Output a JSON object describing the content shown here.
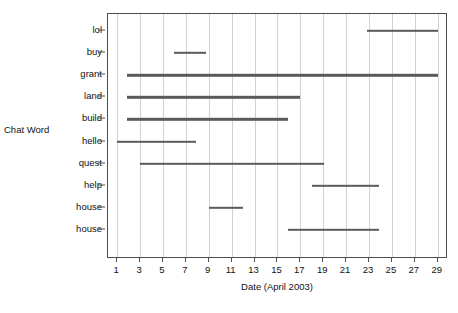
{
  "chart_data": {
    "type": "bar",
    "orientation": "horizontal",
    "title": "",
    "subtitle": "",
    "xlabel": "Date (April 2003)",
    "ylabel": "Chat Word",
    "xlim": [
      0.2,
      29.9
    ],
    "ylim": [
      0,
      11
    ],
    "grid": "vertical-only",
    "legend": "none",
    "xticks": [
      1,
      3,
      5,
      7,
      9,
      11,
      13,
      15,
      17,
      19,
      21,
      23,
      25,
      27,
      29
    ],
    "xtick_labels": [
      "1",
      "3",
      "5",
      "7",
      "9",
      "11",
      "13",
      "15",
      "17",
      "19",
      "21",
      "23",
      "25",
      "27",
      "29"
    ],
    "categories": [
      "lol",
      "buy",
      "grant",
      "land",
      "build",
      "hello",
      "quest",
      "help",
      "house",
      "house"
    ],
    "bar_color": "#5a5a5a",
    "series": [
      {
        "name": "chat word activity span",
        "spans": [
          {
            "category": "lol",
            "start": 22.8,
            "end": 29.0
          },
          {
            "category": "buy",
            "start": 6.0,
            "end": 8.8
          },
          {
            "category": "grant",
            "start": 1.9,
            "end": 29.0
          },
          {
            "category": "land",
            "start": 1.9,
            "end": 17.0
          },
          {
            "category": "build",
            "start": 1.9,
            "end": 15.9
          },
          {
            "category": "hello",
            "start": 1.0,
            "end": 7.9
          },
          {
            "category": "quest",
            "start": 3.0,
            "end": 19.1
          },
          {
            "category": "help",
            "start": 18.0,
            "end": 23.9
          },
          {
            "category": "house",
            "start": 9.0,
            "end": 12.0
          },
          {
            "category": "house",
            "start": 15.9,
            "end": 23.9
          }
        ]
      }
    ]
  }
}
